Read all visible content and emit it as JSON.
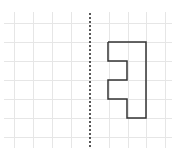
{
  "diagram": {
    "type": "grid-reflection",
    "background": "#ffffff",
    "grid": {
      "color": "#e6e6e6",
      "vertical_x": [
        14,
        33,
        52,
        71,
        109,
        128,
        146,
        165
      ],
      "horizontal_y": [
        23,
        42,
        61,
        80,
        99,
        118,
        137
      ],
      "x_range": [
        4,
        172
      ],
      "y_range": [
        12,
        148
      ]
    },
    "mirror_line": {
      "x": 90,
      "y1": 13,
      "y2": 148,
      "style": "dotted",
      "color": "#222222"
    },
    "shape": {
      "stroke": "#333333",
      "fill": "none",
      "points": [
        [
          108,
          42
        ],
        [
          146,
          42
        ],
        [
          146,
          118
        ],
        [
          127,
          118
        ],
        [
          127,
          99
        ],
        [
          108,
          99
        ],
        [
          108,
          80
        ],
        [
          127,
          80
        ],
        [
          127,
          61
        ],
        [
          108,
          61
        ],
        [
          108,
          42
        ]
      ]
    }
  }
}
